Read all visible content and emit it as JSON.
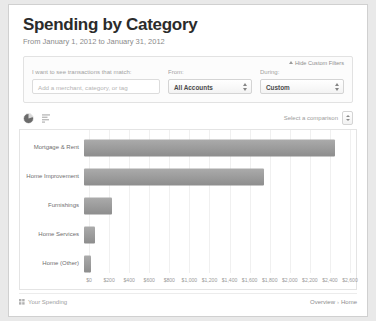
{
  "header": {
    "title": "Spending by Category",
    "subtitle": "From January 1, 2012 to January 31, 2012"
  },
  "filters": {
    "hide_custom_filters_label": "Hide Custom Filters",
    "merchant": {
      "label": "I want to see transactions that match:",
      "placeholder": "Add a merchant, category, or tag",
      "value": ""
    },
    "account": {
      "label": "From:",
      "selected": "All Accounts"
    },
    "during": {
      "label": "During:",
      "selected": "Custom"
    }
  },
  "toolbar": {
    "pie_icon": "pie-chart-icon",
    "bar_icon": "bar-chart-icon",
    "comparison_label": "Select a comparison"
  },
  "footer": {
    "left_label": "Your Spending",
    "left_icon": "grid-icon",
    "breadcrumb_overview": "Overview",
    "breadcrumb_separator": "›",
    "breadcrumb_current": "Home"
  },
  "chart_data": {
    "type": "bar",
    "orientation": "horizontal",
    "title": "Spending by Category",
    "xlabel": "",
    "ylabel": "",
    "xlim": [
      0,
      2600
    ],
    "grid": true,
    "legend": "none",
    "categories": [
      "Mortgage & Rent",
      "Home Improvement",
      "Furnishings",
      "Home Services",
      "Home (Other)"
    ],
    "values": [
      2450,
      1760,
      270,
      105,
      65
    ],
    "tick_labels": [
      "$0",
      "$200",
      "$400",
      "$600",
      "$800",
      "$1,000",
      "$1,200",
      "$1,400",
      "$1,600",
      "$1,800",
      "$2,000",
      "$2,200",
      "$2,400",
      "$2,600"
    ],
    "tick_values": [
      0,
      200,
      400,
      600,
      800,
      1000,
      1200,
      1400,
      1600,
      1800,
      2000,
      2200,
      2400,
      2600
    ],
    "bar_color": "#9a9a9a"
  }
}
